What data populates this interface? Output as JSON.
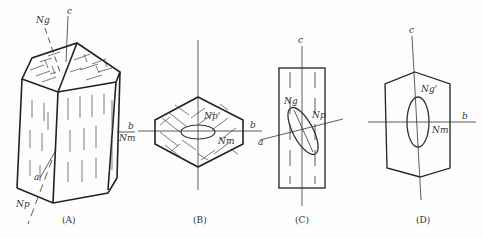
{
  "figure": {
    "panels": [
      {
        "id": "A",
        "caption": "(A)",
        "labels": {
          "ng": "Ng",
          "c": "c",
          "b": "b",
          "nm": "Nm",
          "a": "a",
          "np": "Np"
        }
      },
      {
        "id": "B",
        "caption": "(B)",
        "labels": {
          "np_prime": "Np'",
          "b": "b",
          "nm": "Nm",
          "a": "a"
        }
      },
      {
        "id": "C",
        "caption": "(C)",
        "labels": {
          "c": "c",
          "ng": "Ng",
          "np": "Np",
          "a": "a"
        }
      },
      {
        "id": "D",
        "caption": "(D)",
        "labels": {
          "c": "c",
          "ng_prime": "Ng'",
          "nm": "Nm",
          "b": "b"
        }
      }
    ],
    "colors": {
      "line": "#222222",
      "background": "#fdfdfd"
    }
  }
}
